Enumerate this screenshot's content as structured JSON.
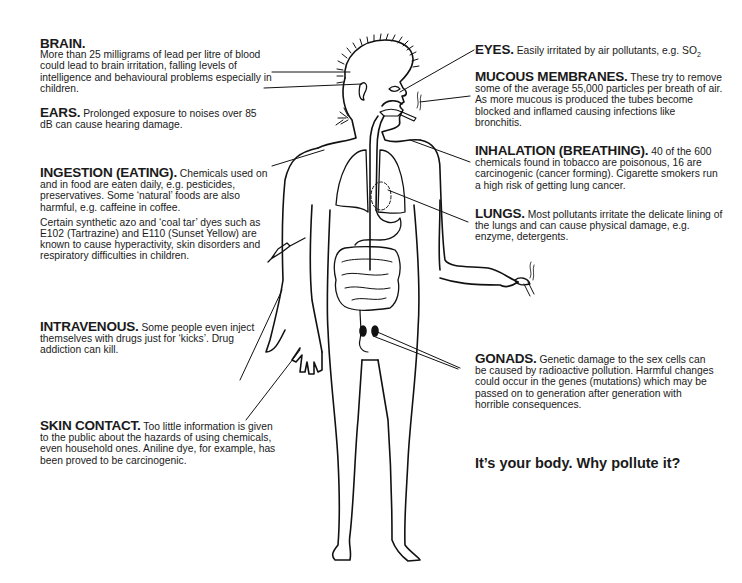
{
  "slogan": "It’s your body. Why pollute it?",
  "annotations": {
    "brain": {
      "title": "BRAIN.",
      "text": "More than 25 milligrams of lead per litre of blood could lead to brain irritation, falling levels of intelligence and behavioural problems especially in children."
    },
    "ears": {
      "title": "EARS.",
      "text": "Prolonged exposure to noises over 85 dB can cause hearing damage."
    },
    "ingestion": {
      "title": "INGESTION (EATING).",
      "text": "Chemicals used on and in food are eaten daily, e.g. pesticides, preservatives. Some ‘natural’ foods are also harmful, e.g. caffeine in coffee.",
      "text2": "Certain synthetic azo and ‘coal tar’ dyes such as E102 (Tartrazine) and E110 (Sunset Yellow) are known to cause hyperactivity, skin disorders and respiratory difficulties in children."
    },
    "intravenous": {
      "title": "INTRAVENOUS.",
      "text": "Some people even inject themselves with drugs just for ‘kicks’. Drug addiction can kill."
    },
    "skin": {
      "title": "SKIN CONTACT.",
      "text": "Too little information is given to the public about the hazards of using chemicals, even household ones. Aniline dye, for example, has been proved to be carcinogenic."
    },
    "eyes": {
      "title": "EYES.",
      "text": "Easily irritated by air pollutants, e.g. SO",
      "sub": "2"
    },
    "mucous": {
      "title": "MUCOUS MEMBRANES.",
      "text": "These try to remove some of the average 55,000 particles per breath of air. As more mucous is produced the tubes become blocked and inflamed causing infections like bronchitis."
    },
    "inhalation": {
      "title": "INHALATION (BREATHING).",
      "text": "40 of the 600 chemicals found in tobacco are poisonous, 16 are carcinogenic (cancer forming). Cigarette smokers run a high risk of getting lung cancer."
    },
    "lungs": {
      "title": "LUNGS.",
      "text": "Most pollutants irritate the delicate lining of the lungs and can cause physical damage, e.g. enzyme, detergents."
    },
    "gonads": {
      "title": "GONADS.",
      "text": "Genetic damage to the sex cells can be caused by radioactive pollution. Harmful changes could occur in the genes (mutations) which may be passed on to generation after generation with horrible consequences."
    }
  }
}
